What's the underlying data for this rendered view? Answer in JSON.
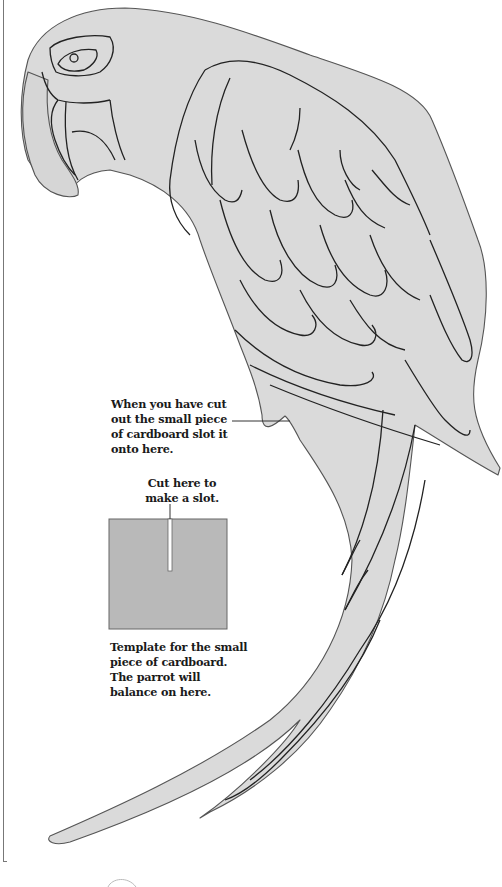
{
  "page": {
    "fill_color": "#d9d9d9",
    "outline_color": "#2a2a2a",
    "card_color": "#b8b8b8"
  },
  "captions": {
    "slot_onto": "When you have cut\nout the small piece\nof cardboard slot it\nonto here.",
    "cut_here": "Cut here to\nmake a slot.",
    "template": "Template for the small\npiece of cardboard.\nThe parrot will\nbalance on here."
  },
  "figures": {
    "parrot": "parrot-outline",
    "card_template": "cardboard-square-with-slot"
  }
}
